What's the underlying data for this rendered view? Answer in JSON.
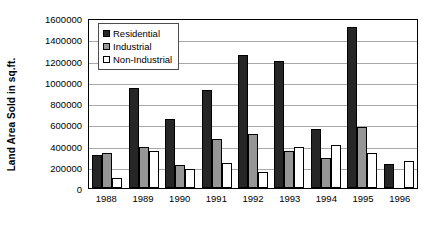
{
  "chart_data": {
    "type": "bar",
    "title": "",
    "subtitle": "",
    "xlabel": "",
    "ylabel": "Land Area Sold in sq.ft.",
    "categories": [
      "1988",
      "1989",
      "1990",
      "1991",
      "1992",
      "1993",
      "1994",
      "1995",
      "1996"
    ],
    "series": [
      {
        "name": "Residential",
        "color": "#262626",
        "values": [
          315000,
          945000,
          645000,
          920000,
          1250000,
          1200000,
          555000,
          1520000,
          230000
        ]
      },
      {
        "name": "Industrial",
        "color": "#969696",
        "values": [
          325000,
          385000,
          215000,
          465000,
          505000,
          345000,
          280000,
          575000,
          0
        ]
      },
      {
        "name": "Non-Industrial",
        "color": "#ffffff",
        "values": [
          95000,
          350000,
          180000,
          240000,
          155000,
          385000,
          405000,
          330000,
          250000
        ]
      }
    ],
    "ylim": [
      0,
      1600000
    ],
    "ytick_labels": [
      "0",
      "200000",
      "400000",
      "600000",
      "800000",
      "1000000",
      "1200000",
      "1400000",
      "1600000"
    ],
    "ytick_values": [
      0,
      200000,
      400000,
      600000,
      800000,
      1000000,
      1200000,
      1400000,
      1600000
    ],
    "grid": true,
    "grid_axis": "y",
    "legend_position": "top-left-inside",
    "legend_entries": [
      "Residential",
      "Industrial",
      "Non-Industrial"
    ]
  }
}
